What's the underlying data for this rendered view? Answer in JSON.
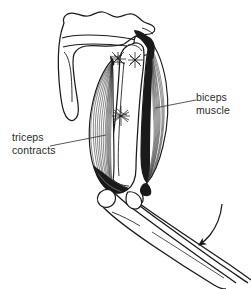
{
  "figure": {
    "background_color": "#ffffff",
    "ink_color": "#1a1a1a",
    "label_color": "#2b2b2b",
    "width": 251,
    "height": 289
  },
  "labels": {
    "biceps": {
      "line1": "biceps",
      "line2": "muscle",
      "full": "biceps muscle"
    },
    "triceps": {
      "line1": "triceps",
      "line2": "contracts",
      "full": "triceps contracts"
    }
  },
  "leader_lines": {
    "biceps": "leader-line-biceps",
    "triceps": "leader-line-triceps"
  },
  "structures": {
    "scapula": "scapula-bone",
    "scapular_spine": "scapular-spine",
    "acromion": "acromion-process",
    "humerus": "humerus-bone",
    "biceps_muscle": "biceps-brachii-muscle",
    "triceps_muscle": "triceps-brachii-muscle",
    "radius": "radius-bone",
    "ulna": "ulna-bone",
    "tendon_upper": "tendon-attachment-upper",
    "tendon_mid": "tendon-attachment-mid"
  },
  "annotations": {
    "motion_arrow": {
      "name": "extension-motion-arrow",
      "direction": "down-left",
      "meaning": "forearm extends"
    }
  }
}
